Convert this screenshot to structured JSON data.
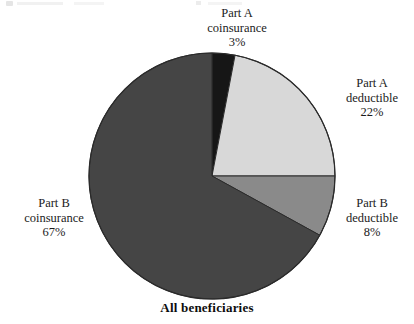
{
  "figure": {
    "caption": "All beneficiaries",
    "background_color": "#ffffff"
  },
  "labels": {
    "part_a_coinsurance": {
      "line1": "Part A",
      "line2": "coinsurance",
      "value": "3%"
    },
    "part_a_deductible": {
      "line1": "Part A",
      "line2": "deductible",
      "value": "22%"
    },
    "part_b_deductible": {
      "line1": "Part B",
      "line2": "deductible",
      "value": "8%"
    },
    "part_b_coinsurance": {
      "line1": "Part B",
      "line2": "coinsurance",
      "value": "67%"
    }
  },
  "chart_data": {
    "type": "pie",
    "title": "All beneficiaries",
    "xlabel": "",
    "ylabel": "",
    "legend_position": "outside-labels",
    "grid": false,
    "start_angle_deg": 0,
    "direction": "clockwise",
    "center": [
      212,
      176
    ],
    "radius": 123,
    "outline_color": "#2b2b2b",
    "categories": [
      "Part A coinsurance",
      "Part A deductible",
      "Part B deductible",
      "Part B coinsurance"
    ],
    "values": [
      3,
      22,
      8,
      67
    ],
    "value_labels": [
      "3%",
      "22%",
      "8%",
      "67%"
    ],
    "units": "percent",
    "total": 100,
    "colors": [
      "#161616",
      "#d8d8d8",
      "#8a8a8a",
      "#454545"
    ],
    "slices": [
      {
        "name": "Part A coinsurance",
        "value": 3,
        "label": "3%",
        "color": "#161616",
        "start_deg": 0.0,
        "end_deg": 10.8
      },
      {
        "name": "Part A deductible",
        "value": 22,
        "label": "22%",
        "color": "#d8d8d8",
        "start_deg": 10.8,
        "end_deg": 90.0
      },
      {
        "name": "Part B deductible",
        "value": 8,
        "label": "8%",
        "color": "#8a8a8a",
        "start_deg": 90.0,
        "end_deg": 118.8
      },
      {
        "name": "Part B coinsurance",
        "value": 67,
        "label": "67%",
        "color": "#454545",
        "start_deg": 118.8,
        "end_deg": 360.0
      }
    ]
  }
}
